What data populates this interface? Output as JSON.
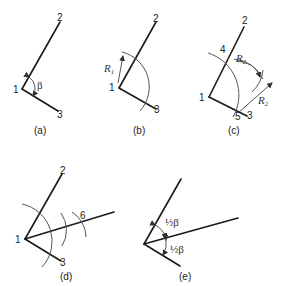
{
  "colors": {
    "line": "#1a1a1a",
    "arc": "#555555",
    "text": "#222222",
    "background": "#ffffff"
  },
  "panels": [
    {
      "caption": "(a)",
      "points": {
        "p1": "1",
        "p2": "2",
        "p3": "3"
      },
      "angle_label": "β"
    },
    {
      "caption": "(b)",
      "points": {
        "p1": "1",
        "p2": "2",
        "p3": "3"
      },
      "radius_label": "R",
      "radius_sub": "1"
    },
    {
      "caption": "(c)",
      "points": {
        "p1": "1",
        "p2": "2",
        "p3": "3",
        "p4": "4",
        "p5": "5"
      },
      "radius_upper_label": "R",
      "radius_upper_sub": "2",
      "radius_lower_label": "R",
      "radius_lower_sub": "2"
    },
    {
      "caption": "(d)",
      "points": {
        "p1": "1",
        "p2": "2",
        "p3": "3",
        "p6": "6"
      }
    },
    {
      "caption": "(e)",
      "half_angle_upper": "½β",
      "half_angle_lower": "½β"
    }
  ]
}
